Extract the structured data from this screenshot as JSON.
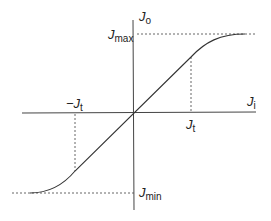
{
  "diagram": {
    "type": "transfer-characteristic",
    "axes": {
      "x_label": "J",
      "x_sub": "i",
      "y_label": "J",
      "y_sub": "o"
    },
    "levels": {
      "max": {
        "label": "J",
        "sub": "max"
      },
      "min": {
        "label": "J",
        "sub": "min"
      }
    },
    "thresholds": {
      "pos": {
        "label": "J",
        "sub": "t"
      },
      "neg": {
        "label": "−J",
        "sub": "t"
      }
    },
    "colors": {
      "stroke": "#333333",
      "dashed": "#555555"
    }
  }
}
